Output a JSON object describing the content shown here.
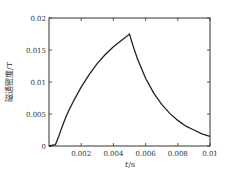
{
  "chart_data": {
    "type": "line",
    "title": "",
    "xlabel": "t/s",
    "xlabel_italic": "t",
    "xlabel_unit": "/s",
    "ylabel": "磁通密度/T",
    "xlim": [
      0,
      0.01
    ],
    "ylim": [
      0,
      0.02
    ],
    "grid": false,
    "legend": null,
    "x_ticks": [
      0.002,
      0.004,
      0.006,
      0.008,
      0.01
    ],
    "x_tick_labels": [
      "0.002",
      "0.004",
      "0.006",
      "0.008",
      "0.01"
    ],
    "y_ticks": [
      0,
      0.005,
      0.01,
      0.015,
      0.02
    ],
    "y_tick_labels": [
      "0",
      "0.005",
      "0.01",
      "0.015",
      "0.02"
    ],
    "series": [
      {
        "name": "磁通密度",
        "color": "#222222",
        "x": [
          0,
          0.0004,
          0.0006,
          0.0008,
          0.001,
          0.0012,
          0.0015,
          0.0018,
          0.002,
          0.0025,
          0.003,
          0.0035,
          0.004,
          0.0045,
          0.005,
          0.0052,
          0.0055,
          0.006,
          0.0065,
          0.007,
          0.0075,
          0.008,
          0.0085,
          0.009,
          0.0095,
          0.01
        ],
        "values": [
          0,
          0.0002,
          0.0015,
          0.0029,
          0.0042,
          0.0054,
          0.0069,
          0.0083,
          0.0092,
          0.0112,
          0.0129,
          0.0143,
          0.0155,
          0.0165,
          0.0175,
          0.0158,
          0.0136,
          0.0106,
          0.0083,
          0.0065,
          0.0051,
          0.004,
          0.0031,
          0.0025,
          0.0019,
          0.0015
        ]
      }
    ]
  },
  "colors": {
    "axis": "#333333",
    "curve": "#222222",
    "background": "#ffffff"
  }
}
